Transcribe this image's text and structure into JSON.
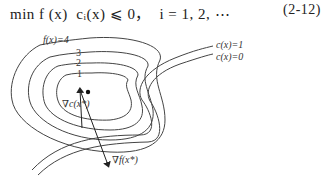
{
  "equation": {
    "text": "minf(x) c_i(x) ≤ 0,   i = 1,2,⋯",
    "display": "min f (x)  cᵢ(x) ⩽ 0，  i = 1, 2, ⋯",
    "number": "(2-12)"
  },
  "figure": {
    "contour_labels": {
      "f4": "f(x)=4",
      "f3": "3",
      "f2": "2",
      "f1": "1"
    },
    "constraint_labels": {
      "c1": "c(x)=1",
      "c0": "c(x)=0"
    },
    "gradient_labels": {
      "grad_c": "∇c(x*)",
      "grad_f": "∇f(x*)"
    },
    "stroke_color": "#444444"
  }
}
